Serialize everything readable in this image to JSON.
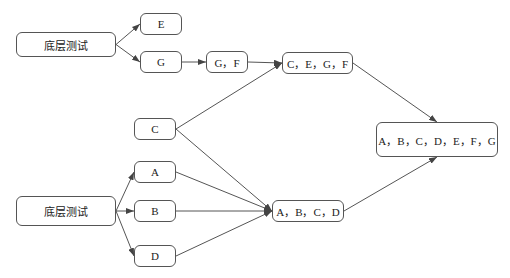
{
  "diagram": {
    "nodes": [
      {
        "id": "bottom1",
        "label": "底层测试",
        "x": 16,
        "y": 32,
        "w": 100,
        "h": 25
      },
      {
        "id": "E",
        "label": "E",
        "x": 140,
        "y": 13,
        "w": 42,
        "h": 22
      },
      {
        "id": "G",
        "label": "G",
        "x": 140,
        "y": 51,
        "w": 42,
        "h": 22
      },
      {
        "id": "GF",
        "label": "G，F",
        "x": 206,
        "y": 51,
        "w": 42,
        "h": 22
      },
      {
        "id": "CEGF",
        "label": "C，E，G，F",
        "x": 282,
        "y": 52,
        "w": 71,
        "h": 22
      },
      {
        "id": "C",
        "label": "C",
        "x": 134,
        "y": 118,
        "w": 42,
        "h": 22
      },
      {
        "id": "ALL",
        "label": "A，B，C，D，E，F，G",
        "x": 376,
        "y": 122,
        "w": 122,
        "h": 35
      },
      {
        "id": "A",
        "label": "A",
        "x": 134,
        "y": 161,
        "w": 42,
        "h": 22
      },
      {
        "id": "bottom2",
        "label": "底层测试",
        "x": 16,
        "y": 196,
        "w": 100,
        "h": 30
      },
      {
        "id": "B",
        "label": "B",
        "x": 134,
        "y": 200,
        "w": 42,
        "h": 22
      },
      {
        "id": "ABCD",
        "label": "A，B，C，D",
        "x": 272,
        "y": 200,
        "w": 72,
        "h": 22
      },
      {
        "id": "D",
        "label": "D",
        "x": 134,
        "y": 245,
        "w": 42,
        "h": 22
      }
    ],
    "edges": [
      {
        "from": "bottom1",
        "to": "E"
      },
      {
        "from": "bottom1",
        "to": "G"
      },
      {
        "from": "G",
        "to": "GF"
      },
      {
        "from": "GF",
        "to": "CEGF"
      },
      {
        "from": "C",
        "to": "CEGF"
      },
      {
        "from": "CEGF",
        "to": "ALL"
      },
      {
        "from": "bottom2",
        "to": "A"
      },
      {
        "from": "bottom2",
        "to": "B"
      },
      {
        "from": "bottom2",
        "to": "D"
      },
      {
        "from": "C",
        "to": "ABCD"
      },
      {
        "from": "A",
        "to": "ABCD"
      },
      {
        "from": "B",
        "to": "ABCD"
      },
      {
        "from": "D",
        "to": "ABCD"
      },
      {
        "from": "ABCD",
        "to": "ALL"
      }
    ],
    "line_color": "#555555"
  }
}
